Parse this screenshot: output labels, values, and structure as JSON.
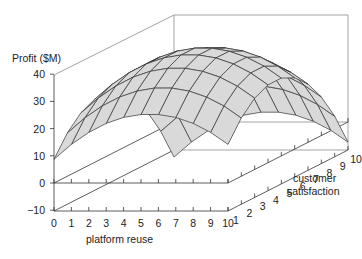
{
  "chart_data": {
    "type": "surface3d",
    "title": "",
    "zlabel": "Profit ($M)",
    "xlabel": "platform reuse",
    "ylabel": "customer satisfaction",
    "z_ticks": [
      40,
      30,
      20,
      10,
      0,
      -10
    ],
    "z_tick_labels": [
      "40",
      "30",
      "20",
      "10",
      "0",
      "−10"
    ],
    "x_ticks": [
      0,
      1,
      2,
      3,
      4,
      5,
      6,
      7,
      8,
      9,
      10
    ],
    "y_ticks": [
      1,
      2,
      3,
      4,
      5,
      6,
      7,
      8,
      9,
      10
    ],
    "zlim": [
      -10,
      40
    ],
    "xlim": [
      0,
      10
    ],
    "ylim": [
      1,
      10
    ],
    "grid": false,
    "surface_fill": "#d9d9d9",
    "surface_line": "#333333",
    "x": [
      0,
      1,
      2,
      3,
      4,
      5,
      6,
      7,
      8,
      9,
      10
    ],
    "y": [
      1,
      2,
      3,
      4,
      5,
      6,
      7,
      8,
      9,
      10
    ],
    "z": [
      [
        8.7,
        14.2,
        18.6,
        21.9,
        24.1,
        25.2,
        25.2,
        24.1,
        21.9,
        18.6,
        14.2
      ],
      [
        15.9,
        21.4,
        25.8,
        29.1,
        31.3,
        32.4,
        32.4,
        31.3,
        29.1,
        25.8,
        21.4
      ],
      [
        20.7,
        26.2,
        30.6,
        33.9,
        36.1,
        37.2,
        37.2,
        36.1,
        33.9,
        30.6,
        26.2
      ],
      [
        23.1,
        28.6,
        33.0,
        36.3,
        38.5,
        39.6,
        39.6,
        38.5,
        36.3,
        33.0,
        28.6
      ],
      [
        23.1,
        28.6,
        33.0,
        36.3,
        38.5,
        39.6,
        39.6,
        38.5,
        36.3,
        33.0,
        28.6
      ],
      [
        20.7,
        26.2,
        30.6,
        33.9,
        36.1,
        37.2,
        37.2,
        36.1,
        33.9,
        30.6,
        26.2
      ],
      [
        15.9,
        21.4,
        25.8,
        29.1,
        31.3,
        32.4,
        32.4,
        31.3,
        29.1,
        25.8,
        21.4
      ],
      [
        8.7,
        14.2,
        18.6,
        21.9,
        24.1,
        25.2,
        25.2,
        24.1,
        21.9,
        18.6,
        14.2
      ],
      [
        -0.9,
        4.6,
        9.0,
        12.3,
        14.5,
        15.6,
        15.6,
        14.5,
        12.3,
        9.0,
        4.6
      ],
      [
        -12.9,
        -7.4,
        -3.0,
        0.3,
        2.5,
        3.6,
        3.6,
        2.5,
        0.3,
        -3.0,
        -7.4
      ]
    ]
  },
  "labels": {
    "zlabel": "Profit ($M)",
    "xlabel": "platform reuse",
    "ylabel_line1": "customer",
    "ylabel_line2": "satisfaction"
  }
}
